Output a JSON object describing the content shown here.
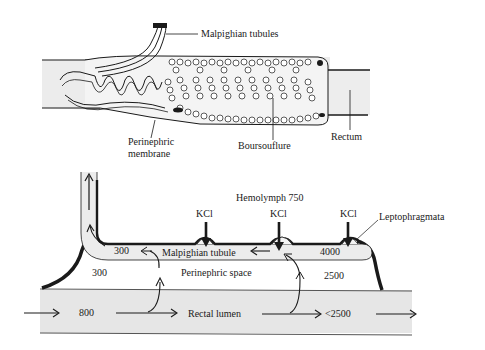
{
  "top_figure": {
    "labels": {
      "malpighian_tubules": "Malpighian tubules",
      "perinephric_membrane_line1": "Perinephric",
      "perinephric_membrane_line2": "membrane",
      "boursouflure": "Boursouflure",
      "rectum": "Rectum"
    }
  },
  "bottom_figure": {
    "hemolymph": "Hemolymph 750",
    "kcl_labels": [
      "KCl",
      "KCl",
      "KCl"
    ],
    "leptophragmata": "Leptophragmata",
    "tubule_left_value": "300",
    "malpighian_tubule": "Malpighian tubule",
    "tubule_right_value": "4000",
    "perinephric_left_value": "300",
    "perinephric_space": "Perinephric space",
    "perinephric_right_value": "2500",
    "lumen_left_value": "800",
    "rectal_lumen": "Rectal lumen",
    "lumen_right_value": "<2500"
  },
  "colors": {
    "ink": "#1a1a1a",
    "tissue_fill": "#e8e8e8",
    "lumen_fill": "#e6e6e6",
    "background": "#ffffff"
  }
}
